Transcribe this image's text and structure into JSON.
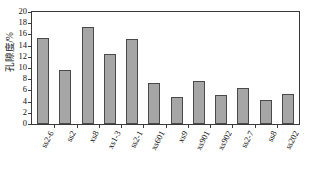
{
  "chart_data": {
    "type": "bar",
    "title": "",
    "xlabel": "",
    "ylabel": "孔隙度/%",
    "ylim": [
      0,
      20
    ],
    "ytick_step": 2,
    "yticks": [
      "0",
      "2",
      "4",
      "6",
      "8",
      "10",
      "12",
      "14",
      "16",
      "18",
      "20"
    ],
    "grid": false,
    "legend": "none",
    "bar_color": "#a6a6a6",
    "bar_edge_color": "#4a4a4a",
    "axis_color": "#3a3a3a",
    "categories": [
      "ss2-6",
      "ss2",
      "xs8",
      "xs1-3",
      "ss2-1",
      "xs601",
      "xs9",
      "xs901",
      "xs902",
      "ss2-7",
      "ss8",
      "ss202"
    ],
    "values": [
      15.4,
      9.6,
      17.4,
      12.5,
      15.1,
      7.4,
      4.9,
      7.7,
      5.1,
      6.4,
      4.2,
      5.3
    ],
    "series": [
      {
        "name": "孔隙度",
        "values": [
          15.4,
          9.6,
          17.4,
          12.5,
          15.1,
          7.4,
          4.9,
          7.7,
          5.1,
          6.4,
          4.2,
          5.3
        ]
      }
    ]
  }
}
